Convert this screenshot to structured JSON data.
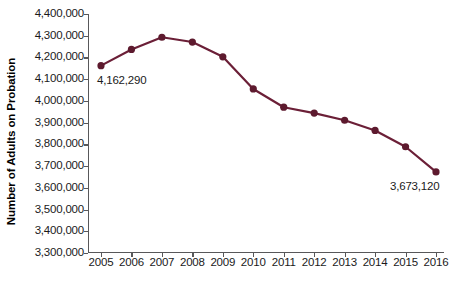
{
  "chart_data": {
    "type": "line",
    "title": "",
    "xlabel": "",
    "ylabel": "Number of Adults on Probation",
    "categories": [
      "2005",
      "2006",
      "2007",
      "2008",
      "2009",
      "2010",
      "2011",
      "2012",
      "2013",
      "2014",
      "2015",
      "2016"
    ],
    "values": [
      4162290,
      4237000,
      4293000,
      4271000,
      4203000,
      4055000,
      3971000,
      3944000,
      3911000,
      3864000,
      3789000,
      3673120
    ],
    "series": [
      {
        "name": "Adults on Probation",
        "values": [
          4162290,
          4237000,
          4293000,
          4271000,
          4203000,
          4055000,
          3971000,
          3944000,
          3911000,
          3864000,
          3789000,
          3673120
        ]
      }
    ],
    "ylim": [
      3300000,
      4400000
    ],
    "ytick_step": 100000,
    "ytick_labels": [
      "4,400,000",
      "4,300,000",
      "4,200,000",
      "4,100,000",
      "4,000,000",
      "3,900,000",
      "3,800,000",
      "3,700,000",
      "3,600,000",
      "3,500,000",
      "3,400,000",
      "3,300,000"
    ],
    "ytick_values": [
      4400000,
      4300000,
      4200000,
      4100000,
      4000000,
      3900000,
      3800000,
      3700000,
      3600000,
      3500000,
      3400000,
      3300000
    ],
    "grid": false,
    "legend": "none",
    "annotations": [
      {
        "name": "first-point-value",
        "text": "4,162,290",
        "category": "2005",
        "value": 4162290
      },
      {
        "name": "last-point-value",
        "text": "3,673,120",
        "category": "2016",
        "value": 3673120
      }
    ],
    "colors": {
      "line": "#6b1f37",
      "marker": "#5d1a2e",
      "axis": "#58585a",
      "text": "#1a1a1a",
      "background": "#ffffff"
    },
    "line_width": 2.2,
    "marker_radius": 3.6
  }
}
